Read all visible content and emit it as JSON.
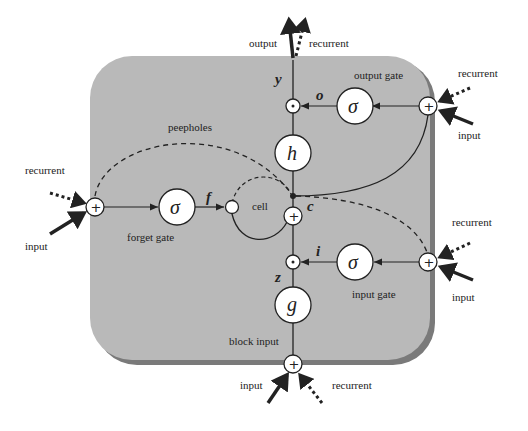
{
  "diagram": {
    "colors": {
      "block_fill": "#b9b9b9",
      "block_shadow": "#7a7a7a",
      "line": "#222222",
      "node_fill": "#ffffff"
    },
    "labels": {
      "output": "output",
      "recurrent_top": "recurrent",
      "output_gate": "output gate",
      "recurrent_right_top": "recurrent",
      "input_right_top": "input",
      "peepholes": "peepholes",
      "recurrent_left": "recurrent",
      "input_left": "input",
      "forget_gate": "forget gate",
      "cell": "cell",
      "recurrent_right_bottom": "recurrent",
      "input_right_bottom": "input",
      "input_gate": "input gate",
      "block_input": "block input",
      "input_bottom": "input",
      "recurrent_bottom": "recurrent"
    },
    "symbols": {
      "y": "y",
      "o": "o",
      "f": "f",
      "c": "c",
      "i": "i",
      "z": "z",
      "sigma": "σ",
      "h": "h",
      "g": "g",
      "plus": "+",
      "dot": "·"
    }
  }
}
